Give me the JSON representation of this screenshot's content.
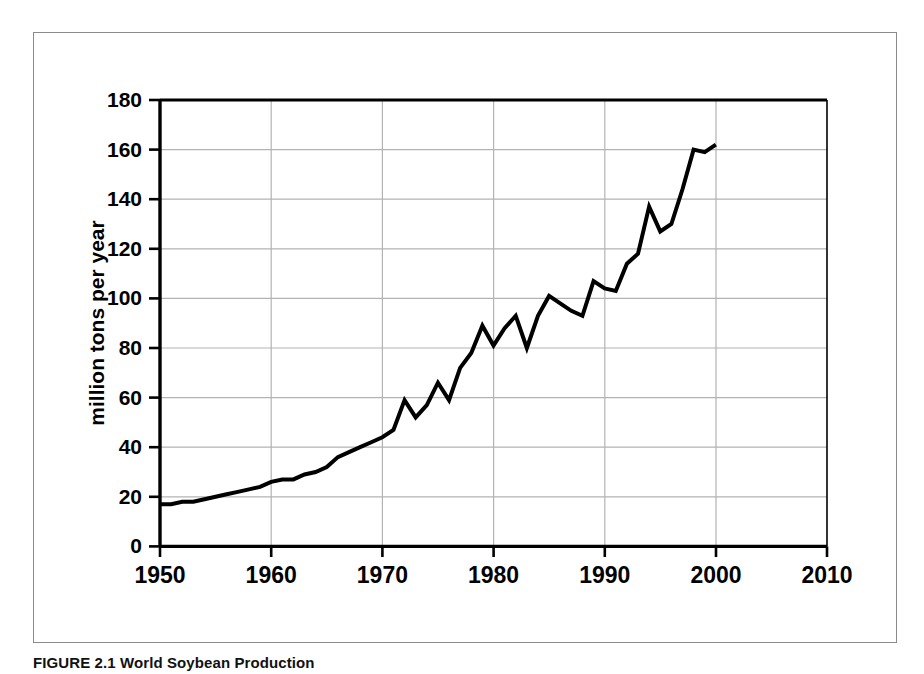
{
  "figure": {
    "caption": "FIGURE 2.1 World Soybean Production",
    "caption_label": "FIGURE 2.1",
    "caption_title": "World Soybean Production"
  },
  "chart_data": {
    "type": "line",
    "title": "",
    "xlabel": "",
    "ylabel": "million tons per year",
    "xlim": [
      1950,
      2010
    ],
    "ylim": [
      0,
      180
    ],
    "xticks": [
      1950,
      1960,
      1970,
      1980,
      1990,
      2000,
      2010
    ],
    "yticks": [
      0,
      20,
      40,
      60,
      80,
      100,
      120,
      140,
      160,
      180
    ],
    "grid": true,
    "grid_color": "#b3b3b3",
    "legend": null,
    "line_color": "#000000",
    "line_width": 4,
    "series": [
      {
        "name": "World soybean production",
        "x": [
          1950,
          1951,
          1952,
          1953,
          1954,
          1955,
          1956,
          1957,
          1958,
          1959,
          1960,
          1961,
          1962,
          1963,
          1964,
          1965,
          1966,
          1967,
          1968,
          1969,
          1970,
          1971,
          1972,
          1973,
          1974,
          1975,
          1976,
          1977,
          1978,
          1979,
          1980,
          1981,
          1982,
          1983,
          1984,
          1985,
          1986,
          1987,
          1988,
          1989,
          1990,
          1991,
          1992,
          1993,
          1994,
          1995,
          1996,
          1997,
          1998,
          1999,
          2000
        ],
        "values": [
          17,
          17,
          18,
          18,
          19,
          20,
          21,
          22,
          23,
          24,
          26,
          27,
          27,
          29,
          30,
          32,
          36,
          38,
          40,
          42,
          44,
          47,
          59,
          52,
          57,
          66,
          59,
          72,
          78,
          89,
          81,
          88,
          93,
          80,
          93,
          101,
          98,
          95,
          93,
          107,
          104,
          103,
          114,
          118,
          137,
          127,
          130,
          144,
          160,
          159,
          162
        ]
      }
    ]
  },
  "axes": {
    "y_title": "million tons per year",
    "y_tick_labels": [
      "0",
      "20",
      "40",
      "60",
      "80",
      "100",
      "120",
      "140",
      "160",
      "180"
    ],
    "x_tick_labels": [
      "1950",
      "1960",
      "1970",
      "1980",
      "1990",
      "2000",
      "2010"
    ]
  }
}
